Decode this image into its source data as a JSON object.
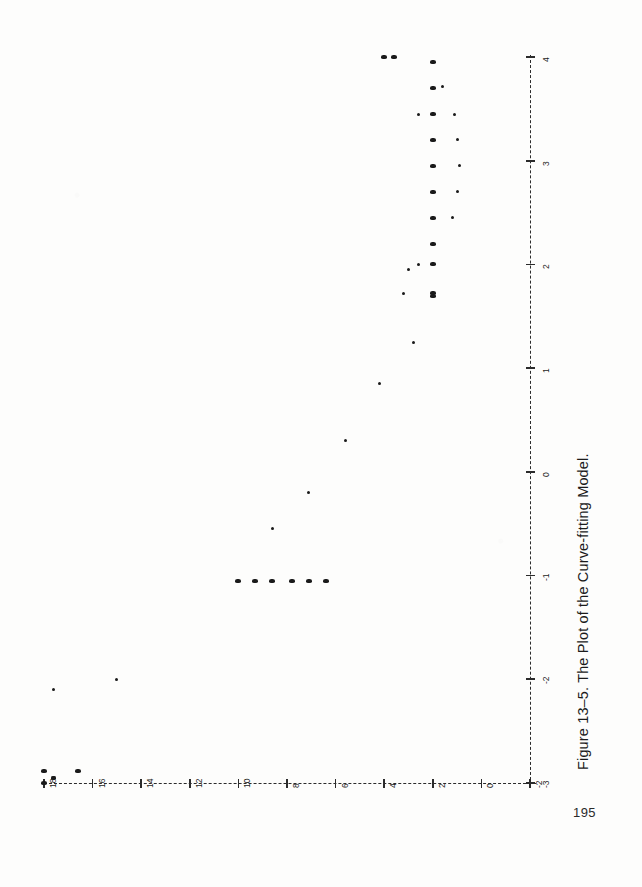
{
  "document": {
    "page_number": "195",
    "caption": "Figure 13–5.  The Plot of the Curve-fitting Model."
  },
  "chart_data": {
    "type": "scatter",
    "title": "Figure 13–5.  The Plot of the Curve-fitting Model.",
    "orientation": "rotated-90-landscape-on-portrait-page",
    "xlabel": "",
    "ylabel": "",
    "xlim": [
      -3,
      4
    ],
    "ylim": [
      -2,
      18
    ],
    "grid": false,
    "legend": null,
    "x_ticks": [
      -3,
      -2,
      -1,
      0,
      1,
      2,
      3,
      4
    ],
    "x_tick_labels": [
      "-3",
      "-2",
      "-1",
      "0",
      "1",
      "2",
      "3",
      "4"
    ],
    "y_ticks": [
      -2,
      0,
      2,
      4,
      6,
      8,
      10,
      12,
      14,
      16,
      18
    ],
    "y_tick_labels": [
      "-2",
      "0",
      "2",
      "4",
      "6",
      "8",
      "10",
      "12",
      "14",
      "16",
      "18"
    ],
    "axis_style": "dashed",
    "series": [
      {
        "name": "observed",
        "marker": "filled-square",
        "points": [
          {
            "x": -3.0,
            "y": 18.0,
            "size": "big"
          },
          {
            "x": -2.95,
            "y": 17.6,
            "size": "mid"
          },
          {
            "x": -2.88,
            "y": 18.0,
            "size": "big"
          },
          {
            "x": -2.88,
            "y": 16.6,
            "size": "big"
          },
          {
            "x": -2.1,
            "y": 17.6,
            "size": "small"
          },
          {
            "x": -2.0,
            "y": 15.0,
            "size": "small"
          },
          {
            "x": -1.05,
            "y": 10.0,
            "size": "big"
          },
          {
            "x": -1.05,
            "y": 9.3,
            "size": "big"
          },
          {
            "x": -1.05,
            "y": 8.6,
            "size": "big"
          },
          {
            "x": -1.05,
            "y": 7.8,
            "size": "big"
          },
          {
            "x": -1.05,
            "y": 7.1,
            "size": "big"
          },
          {
            "x": -1.05,
            "y": 6.4,
            "size": "big"
          },
          {
            "x": -0.55,
            "y": 8.6,
            "size": "small"
          },
          {
            "x": -0.2,
            "y": 7.1,
            "size": "small"
          },
          {
            "x": 0.3,
            "y": 5.6,
            "size": "small"
          },
          {
            "x": 0.85,
            "y": 4.2,
            "size": "small"
          },
          {
            "x": 1.25,
            "y": 2.8,
            "size": "small"
          },
          {
            "x": 1.7,
            "y": 2.0,
            "size": "big"
          },
          {
            "x": 1.72,
            "y": 2.0,
            "size": "big"
          },
          {
            "x": 2.0,
            "y": 2.0,
            "size": "big"
          },
          {
            "x": 2.2,
            "y": 2.0,
            "size": "big"
          },
          {
            "x": 2.45,
            "y": 2.0,
            "size": "big"
          },
          {
            "x": 2.7,
            "y": 2.0,
            "size": "big"
          },
          {
            "x": 2.95,
            "y": 2.0,
            "size": "big"
          },
          {
            "x": 3.2,
            "y": 2.0,
            "size": "big"
          },
          {
            "x": 3.45,
            "y": 2.0,
            "size": "big"
          },
          {
            "x": 3.7,
            "y": 2.0,
            "size": "big"
          },
          {
            "x": 3.95,
            "y": 2.0,
            "size": "big"
          },
          {
            "x": 2.0,
            "y": 2.6,
            "size": "small"
          },
          {
            "x": 3.45,
            "y": 2.6,
            "size": "small"
          },
          {
            "x": 3.72,
            "y": 1.6,
            "size": "small"
          },
          {
            "x": 2.45,
            "y": 1.2,
            "size": "small"
          },
          {
            "x": 2.7,
            "y": 1.0,
            "size": "small"
          },
          {
            "x": 2.95,
            "y": 0.9,
            "size": "small"
          },
          {
            "x": 3.2,
            "y": 1.0,
            "size": "small"
          },
          {
            "x": 3.45,
            "y": 1.1,
            "size": "small"
          },
          {
            "x": 1.72,
            "y": 3.2,
            "size": "small"
          },
          {
            "x": 1.95,
            "y": 3.0,
            "size": "small"
          },
          {
            "x": 4.0,
            "y": 3.6,
            "size": "big"
          },
          {
            "x": 4.0,
            "y": 4.0,
            "size": "big"
          }
        ]
      }
    ]
  },
  "colors": {
    "ink": "#1a1a1a",
    "axis": "#2b2b2b",
    "paper": "#fdfdfc"
  }
}
